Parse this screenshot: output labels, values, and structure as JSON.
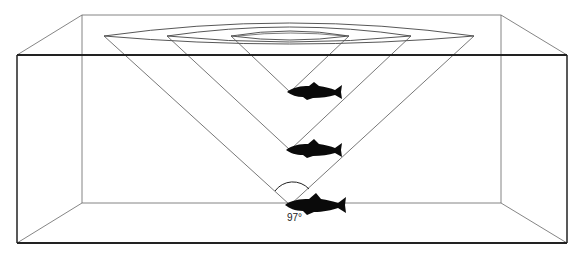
{
  "diagram": {
    "type": "fish-vision-cones",
    "angle_label": "97°",
    "colors": {
      "line": "#555555",
      "frame": "#222222",
      "fish": "#0a0a0a",
      "background": "#ffffff"
    },
    "fish": [
      {
        "label": "fish-shallow",
        "x": 290,
        "y": 92
      },
      {
        "label": "fish-middle",
        "x": 290,
        "y": 150
      },
      {
        "label": "fish-deep",
        "x": 290,
        "y": 205
      }
    ]
  }
}
